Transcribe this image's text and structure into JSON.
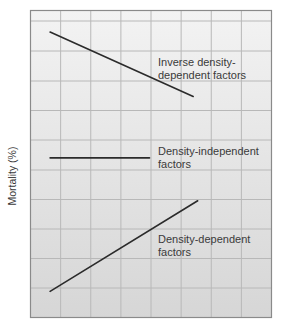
{
  "chart_data": {
    "type": "line",
    "title": "",
    "xlabel": "",
    "ylabel": "Mortality (%)",
    "x_ticks_labeled": false,
    "y_ticks_labeled": false,
    "grid": true,
    "grid_columns": 8,
    "grid_rows": 10,
    "xlim": [
      0,
      8
    ],
    "ylim": [
      0,
      10
    ],
    "series": [
      {
        "name": "Inverse density-dependent factors",
        "label_lines": [
          "Inverse density-",
          "dependent factors"
        ],
        "x": [
          0.65,
          5.4
        ],
        "y": [
          9.3,
          7.2
        ],
        "trend": "decreasing"
      },
      {
        "name": "Density-independent factors",
        "label_lines": [
          "Density-independent",
          "factors"
        ],
        "x": [
          0.65,
          3.95
        ],
        "y": [
          5.2,
          5.2
        ],
        "trend": "constant"
      },
      {
        "name": "Density-dependent factors",
        "label_lines": [
          "Density-dependent",
          "factors"
        ],
        "x": [
          0.65,
          5.55
        ],
        "y": [
          0.85,
          3.8
        ],
        "trend": "increasing"
      }
    ],
    "legend": "none (inline annotations)"
  },
  "style": {
    "line_color": "#2b2b2b",
    "grid_color": "#b8b8b8",
    "border_color": "#8a8a8a",
    "bg_top": "#f3f3f3",
    "bg_bottom": "#d6d6d6",
    "text_color": "#3a3a3a"
  }
}
